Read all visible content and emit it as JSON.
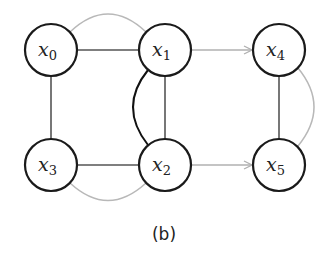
{
  "diagram": {
    "caption": "(b)",
    "nodes": [
      {
        "id": "x0",
        "var": "x",
        "sub": "0",
        "cx": 51,
        "cy": 50
      },
      {
        "id": "x1",
        "var": "x",
        "sub": "1",
        "cx": 165,
        "cy": 50
      },
      {
        "id": "x4",
        "var": "x",
        "sub": "4",
        "cx": 279,
        "cy": 50
      },
      {
        "id": "x3",
        "var": "x",
        "sub": "3",
        "cx": 51,
        "cy": 165
      },
      {
        "id": "x2",
        "var": "x",
        "sub": "2",
        "cx": 165,
        "cy": 165
      },
      {
        "id": "x5",
        "var": "x",
        "sub": "5",
        "cx": 279,
        "cy": 165
      }
    ],
    "edges": [
      {
        "from": "x0",
        "to": "x1",
        "style": "dark-straight"
      },
      {
        "from": "x0",
        "to": "x3",
        "style": "dark-straight"
      },
      {
        "from": "x3",
        "to": "x2",
        "style": "dark-straight"
      },
      {
        "from": "x1",
        "to": "x2",
        "style": "dark-straight"
      },
      {
        "from": "x1",
        "to": "x2",
        "style": "black-curved"
      },
      {
        "from": "x4",
        "to": "x5",
        "style": "dark-straight"
      },
      {
        "from": "x0",
        "to": "x1",
        "style": "gray-arc-top"
      },
      {
        "from": "x3",
        "to": "x2",
        "style": "gray-arc-bottom"
      },
      {
        "from": "x4",
        "to": "x5",
        "style": "gray-arc-right"
      },
      {
        "from": "x1",
        "to": "x4",
        "style": "gray-arrow"
      },
      {
        "from": "x2",
        "to": "x5",
        "style": "gray-arrow"
      }
    ],
    "colors": {
      "node_stroke": "#1a1a1a",
      "dark_edge": "#444444",
      "gray_edge": "#b0b0b0",
      "background": "#ffffff"
    }
  }
}
